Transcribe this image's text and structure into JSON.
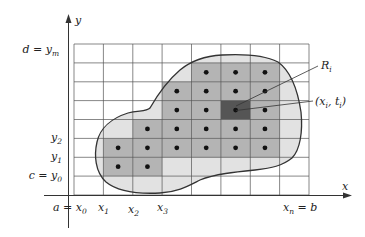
{
  "figure": {
    "colors": {
      "grid": "#555555",
      "region_fill": "#e2e2e2",
      "inner_cell_fill": "#b4b4b4",
      "highlight_cell_fill": "#555555",
      "boundary": "#333333",
      "dot": "#111111",
      "axis": "#333333"
    },
    "grid": {
      "x_lines": [
        74,
        103.4,
        132.8,
        162.1,
        191.5,
        220.9,
        250.3,
        279.6,
        309
      ],
      "y_lines": [
        44,
        62.9,
        81.8,
        100.6,
        119.5,
        138.4,
        157.3,
        176.1,
        195
      ],
      "columns": 8,
      "rows": 8
    },
    "inner_cells": [
      [
        1,
        4
      ],
      [
        1,
        5
      ],
      [
        1,
        6
      ],
      [
        2,
        3
      ],
      [
        2,
        4
      ],
      [
        2,
        5
      ],
      [
        2,
        6
      ],
      [
        3,
        3
      ],
      [
        3,
        4
      ],
      [
        3,
        5
      ],
      [
        3,
        6
      ],
      [
        4,
        2
      ],
      [
        4,
        3
      ],
      [
        4,
        4
      ],
      [
        4,
        5
      ],
      [
        4,
        6
      ],
      [
        5,
        1
      ],
      [
        5,
        2
      ],
      [
        5,
        3
      ],
      [
        5,
        4
      ],
      [
        5,
        5
      ],
      [
        5,
        6
      ],
      [
        6,
        1
      ],
      [
        6,
        2
      ]
    ],
    "highlight_cell": [
      3,
      5
    ],
    "axes": {
      "x_axis_label": "x",
      "y_axis_label": "y"
    },
    "y_labels": [
      {
        "main": "d = y",
        "sub": "m",
        "y": 48
      },
      {
        "main": "y",
        "sub": "2",
        "y": 143
      },
      {
        "main": "y",
        "sub": "1",
        "y": 161
      },
      {
        "main": "c = y",
        "sub": "0",
        "y": 180
      }
    ],
    "x_labels": [
      {
        "main": "a = x",
        "sub": "0",
        "x": 40
      },
      {
        "main": "x",
        "sub": "1",
        "x": 96
      },
      {
        "main": "x",
        "sub": "2",
        "x": 125
      },
      {
        "main": "x",
        "sub": "3",
        "x": 155
      },
      {
        "main": "x",
        "sub": "n",
        "suffix": " = b",
        "x": 283
      }
    ],
    "annotations": {
      "region_label_main": "R",
      "region_label_sub": "i",
      "point_label_open": "(x",
      "point_label_sub1": "i",
      "point_label_mid": ", t",
      "point_label_sub2": "i",
      "point_label_close": ")"
    }
  }
}
